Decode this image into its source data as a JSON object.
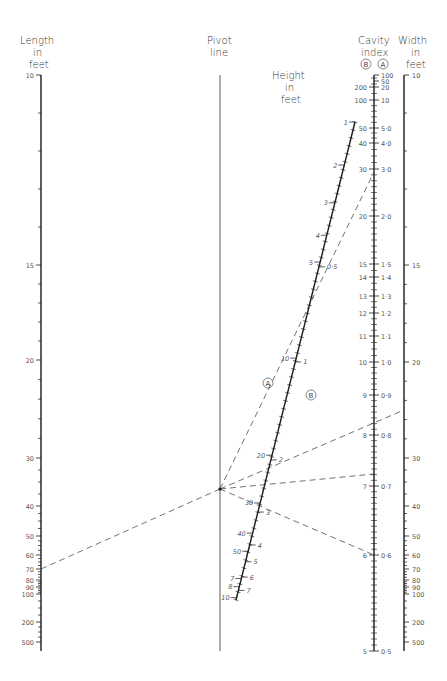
{
  "titles": {
    "length": [
      "Length",
      "in",
      "feet"
    ],
    "pivot": [
      "Pivot",
      "line"
    ],
    "height": [
      "Height",
      "in",
      "feet"
    ],
    "cavity": [
      "Cavity",
      "index"
    ],
    "cavity_b_marker": "B",
    "cavity_a_marker": "A",
    "width": [
      "Width",
      "in",
      "feet"
    ]
  },
  "markers": {
    "line_a": "A",
    "line_b": "B"
  },
  "colors": {
    "ink": "#1a1a1a",
    "text": "#444444",
    "background": "#ffffff"
  },
  "chart_data": {
    "type": "nomogram",
    "axes": [
      {
        "name": "Length in feet",
        "scale": "log",
        "ticks": [
          "10",
          "15",
          "20",
          "30",
          "40",
          "50",
          "60",
          "70",
          "80",
          "90",
          "100",
          "200",
          "500"
        ]
      },
      {
        "name": "Pivot line",
        "ticks": []
      },
      {
        "name": "Height in feet",
        "scale": "log",
        "left_ticks": [
          "1",
          "2",
          "3",
          "4",
          "5",
          "10",
          "20",
          "30",
          "40",
          "50",
          "7",
          "8",
          "10"
        ],
        "right_ticks": [
          "0.5",
          "1",
          "2",
          "3",
          "4",
          "5",
          "6",
          "7"
        ]
      },
      {
        "name": "Cavity index",
        "scale_B": [
          "200",
          "100",
          "50",
          "40",
          "30",
          "20",
          "15",
          "14",
          "13",
          "12",
          "11",
          "10",
          "9",
          "8",
          "7",
          "6",
          "5"
        ],
        "scale_A": [
          "100",
          "50",
          "20",
          "10",
          "5.0",
          "4.0",
          "3.0",
          "2.0",
          "1.5",
          "1.4",
          "1.3",
          "1.2",
          "1.1",
          "1.0",
          "0.9",
          "0.8",
          "0.7",
          "0.6",
          "0.5"
        ]
      },
      {
        "name": "Width in feet",
        "scale": "log",
        "ticks": [
          "10",
          "15",
          "20",
          "30",
          "40",
          "50",
          "60",
          "70",
          "80",
          "90",
          "100",
          "200",
          "500"
        ]
      }
    ],
    "example_lines": [
      {
        "from": "Length 70",
        "to": "Pivot point"
      },
      {
        "from": "Pivot point",
        "to": "Cavity A ≈ 2.8",
        "label": "A"
      },
      {
        "from": "Pivot point",
        "to": "Width ≈ 25"
      },
      {
        "from": "Pivot point",
        "to": "Cavity ≈ 7.2 / 0.72"
      },
      {
        "from": "Pivot point",
        "to": "Cavity 6 / 0.6"
      }
    ]
  },
  "length_ticks": [
    {
      "v": "10",
      "y": 75
    },
    {
      "v": "15",
      "y": 265
    },
    {
      "v": "20",
      "y": 360
    },
    {
      "v": "30",
      "y": 458
    },
    {
      "v": "40",
      "y": 506
    },
    {
      "v": "50",
      "y": 536
    },
    {
      "v": "60",
      "y": 555
    },
    {
      "v": "70",
      "y": 569
    },
    {
      "v": "80",
      "y": 580
    },
    {
      "v": "90",
      "y": 587
    },
    {
      "v": "100",
      "y": 594
    },
    {
      "v": "200",
      "y": 622
    },
    {
      "v": "500",
      "y": 642
    }
  ],
  "width_ticks": [
    {
      "v": "10",
      "y": 75
    },
    {
      "v": "15",
      "y": 265
    },
    {
      "v": "20",
      "y": 362
    },
    {
      "v": "30",
      "y": 458
    },
    {
      "v": "40",
      "y": 506
    },
    {
      "v": "50",
      "y": 536
    },
    {
      "v": "60",
      "y": 555
    },
    {
      "v": "70",
      "y": 569
    },
    {
      "v": "80",
      "y": 580
    },
    {
      "v": "90",
      "y": 587
    },
    {
      "v": "100",
      "y": 594
    },
    {
      "v": "200",
      "y": 622
    },
    {
      "v": "500",
      "y": 642
    }
  ],
  "cavity_b_ticks": [
    {
      "v": "200",
      "y": 87
    },
    {
      "v": "100",
      "y": 100
    },
    {
      "v": "50",
      "y": 128
    },
    {
      "v": "40",
      "y": 143
    },
    {
      "v": "30",
      "y": 169
    },
    {
      "v": "20",
      "y": 216
    },
    {
      "v": "15",
      "y": 264
    },
    {
      "v": "14",
      "y": 277
    },
    {
      "v": "13",
      "y": 296
    },
    {
      "v": "12",
      "y": 313
    },
    {
      "v": "11",
      "y": 336
    },
    {
      "v": "10",
      "y": 362
    },
    {
      "v": "9",
      "y": 395
    },
    {
      "v": "8",
      "y": 435
    },
    {
      "v": "7",
      "y": 486
    },
    {
      "v": "6",
      "y": 555
    },
    {
      "v": "5",
      "y": 651
    }
  ],
  "cavity_a_ticks": [
    {
      "v": "100",
      "y": 75
    },
    {
      "v": "50",
      "y": 81
    },
    {
      "v": "20",
      "y": 87
    },
    {
      "v": "10",
      "y": 100
    },
    {
      "v": "5·0",
      "y": 128
    },
    {
      "v": "4·0",
      "y": 143
    },
    {
      "v": "3·0",
      "y": 169
    },
    {
      "v": "2·0",
      "y": 216
    },
    {
      "v": "1·5",
      "y": 264
    },
    {
      "v": "1·4",
      "y": 277
    },
    {
      "v": "1·3",
      "y": 296
    },
    {
      "v": "1·2",
      "y": 313
    },
    {
      "v": "1·1",
      "y": 336
    },
    {
      "v": "1·0",
      "y": 362
    },
    {
      "v": "0·9",
      "y": 395
    },
    {
      "v": "0·8",
      "y": 435
    },
    {
      "v": "0·7",
      "y": 486
    },
    {
      "v": "0·6",
      "y": 555
    },
    {
      "v": "0·5",
      "y": 651
    }
  ],
  "height_left_ticks": [
    {
      "v": "1",
      "t": 0.0
    },
    {
      "v": "2",
      "t": 0.09
    },
    {
      "v": "3",
      "t": 0.169
    },
    {
      "v": "4",
      "t": 0.237
    },
    {
      "v": "5",
      "t": 0.293
    },
    {
      "v": "10",
      "t": 0.494
    },
    {
      "v": "20",
      "t": 0.697
    },
    {
      "v": "30",
      "t": 0.797
    },
    {
      "v": "40",
      "t": 0.86
    },
    {
      "v": "50",
      "t": 0.898
    },
    {
      "v": "7",
      "t": 0.955
    },
    {
      "v": "8",
      "t": 0.972
    },
    {
      "v": "10",
      "t": 0.995
    }
  ],
  "height_right_ticks": [
    {
      "v": "0·5",
      "t": 0.303
    },
    {
      "v": "1",
      "t": 0.502
    },
    {
      "v": "2",
      "t": 0.707
    },
    {
      "v": "3",
      "t": 0.816
    },
    {
      "v": "4",
      "t": 0.885
    },
    {
      "v": "5",
      "t": 0.92
    },
    {
      "v": "6",
      "t": 0.952
    },
    {
      "v": "7",
      "t": 0.98
    }
  ]
}
